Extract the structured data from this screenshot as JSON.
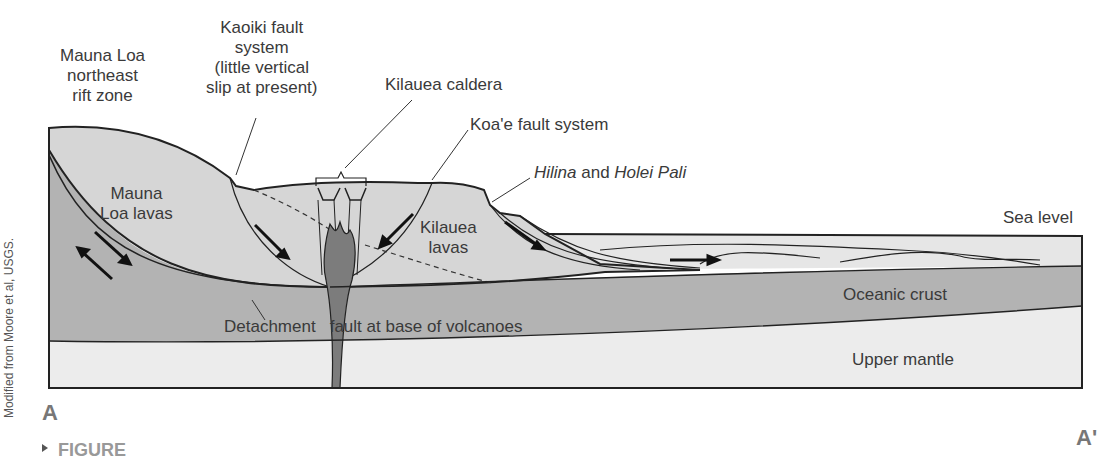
{
  "diagram": {
    "type": "geologic cross-section",
    "section_labels": {
      "start": "A",
      "end": "A'"
    },
    "credit": "Modified from Moore et al, USGS.",
    "caption_partial": "FIGURE",
    "callouts": {
      "mauna_loa_rift": [
        "Mauna Loa",
        "northeast",
        "rift zone"
      ],
      "kaoiki": [
        "Kaoiki fault",
        "system",
        "(little vertical",
        "slip at present)"
      ],
      "kilauea_caldera": "Kilauea caldera",
      "koae": "Koa'e fault system",
      "hilina_holei": {
        "part1": "Hilina",
        "part2": " and ",
        "part3": "Holei Pali"
      }
    },
    "units": {
      "mauna_loa_lavas": [
        "Mauna",
        "Loa lavas"
      ],
      "kilauea_lavas": [
        "Kilauea",
        "lavas"
      ],
      "oceanic_crust": "Oceanic crust",
      "upper_mantle": "Upper mantle",
      "sea_level": "Sea level",
      "detachment": {
        "part1": "Detachment",
        "part2": "fault at base of volcanoes"
      }
    },
    "colors": {
      "volcano_fill": "#d6d6d6",
      "crust_fill": "#b3b3b3",
      "mantle_fill": "#ececec",
      "sea_fill": "#e6e6e6",
      "magma_fill": "#7c7c7c",
      "line": "#222222"
    }
  }
}
